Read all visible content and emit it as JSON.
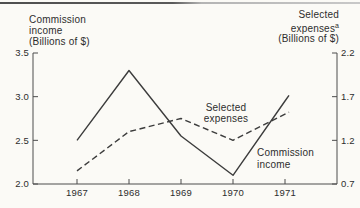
{
  "chart": {
    "left_axis": {
      "title_lines": [
        "Commission",
        "income",
        "(Billions of $)"
      ],
      "ticks": [
        "3.5",
        "3.0",
        "2.5",
        "2.0"
      ]
    },
    "right_axis": {
      "title_lines": [
        "Selected",
        "expenses",
        "(Billions of $)"
      ],
      "footnote_marker": "a",
      "ticks": [
        "2.2",
        "1.7",
        "1.2",
        "0.7"
      ]
    },
    "x_axis": {
      "labels": [
        "1967",
        "1968",
        "1969",
        "1970",
        "1971"
      ]
    },
    "annotations": {
      "expenses": {
        "line1": "Selected",
        "line2": "expenses"
      },
      "income": {
        "line1": "Commission",
        "line2": "income"
      }
    },
    "colors": {
      "line": "#3c3c3c",
      "axis": "#4c4c4c",
      "text": "#2d2d2d",
      "background": "#fbfaf6"
    }
  },
  "chart_data": {
    "type": "line",
    "x": [
      1967,
      1968,
      1969,
      1970,
      1971
    ],
    "series": [
      {
        "name": "Commission income",
        "axis": "left",
        "style": "solid",
        "values": [
          2.5,
          3.3,
          2.55,
          2.1,
          2.95
        ]
      },
      {
        "name": "Selected expenses",
        "axis": "right",
        "style": "dashed",
        "values": [
          0.85,
          1.3,
          1.45,
          1.2,
          1.5
        ]
      }
    ],
    "title": "",
    "xlabel": "",
    "left_ylabel": "Commission income (Billions of $)",
    "right_ylabel": "Selected expenses (Billions of $)",
    "left_ylim": [
      2.0,
      3.5
    ],
    "right_ylim": [
      0.7,
      2.2
    ],
    "grid": false,
    "legend_position": "inline-annotations"
  }
}
